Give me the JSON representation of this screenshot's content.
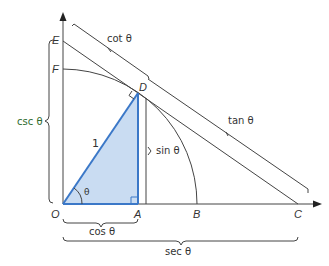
{
  "diagram": {
    "type": "unit-circle-trig-functions",
    "colors": {
      "triangle_fill": "#c9dcf2",
      "triangle_stroke": "#3b78c8",
      "line": "#444444",
      "label": "#333333",
      "csc_label": "#2e6b2e"
    },
    "points": {
      "O": "O",
      "A": "A",
      "B": "B",
      "C": "C",
      "D": "D",
      "E": "E",
      "F": "F"
    },
    "labels": {
      "hypotenuse": "1",
      "angle": "θ",
      "sin": "sin θ",
      "cos": "cos θ",
      "tan": "tan θ",
      "cot": "cot θ",
      "sec": "sec θ",
      "csc": "csc θ"
    }
  }
}
